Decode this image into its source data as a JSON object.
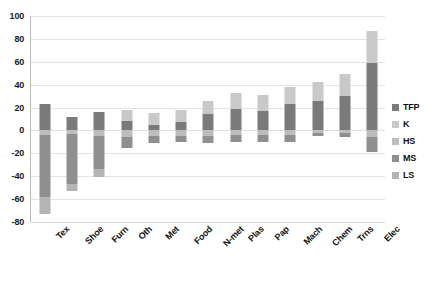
{
  "chart_data": {
    "type": "bar",
    "stacked": true,
    "title": "",
    "subtitle": "",
    "xlabel": "",
    "ylabel": "",
    "ylim": [
      -80,
      100
    ],
    "ytick_step": 20,
    "yticks": [
      100,
      80,
      60,
      40,
      20,
      0,
      -20,
      -40,
      -60,
      -80
    ],
    "ytick_labels": [
      "100",
      "80",
      "60",
      "40",
      "20",
      "0",
      "-20",
      "-40",
      "-60",
      "-80"
    ],
    "grid": true,
    "grid_axis": "y",
    "legend_position": "right",
    "categories": [
      "Tex",
      "Shoe",
      "Furn",
      "Oth",
      "Met",
      "Food",
      "N-met",
      "Plas",
      "Pap",
      "Mach",
      "Chem",
      "Trns",
      "Elec"
    ],
    "series": [
      {
        "name": "TFP",
        "color": "#7a7a7a",
        "values": [
          23,
          12,
          16,
          8,
          5,
          7,
          14,
          19,
          17,
          23,
          26,
          30,
          59
        ]
      },
      {
        "name": "K",
        "color": "#c9c9c9",
        "values": [
          0,
          0,
          0,
          10,
          10,
          11,
          12,
          14,
          14,
          15,
          16,
          19,
          28
        ]
      },
      {
        "name": "HS",
        "color": "#bdbdbd",
        "values": [
          -4,
          -3,
          -5,
          -6,
          -5,
          -5,
          -5,
          -4,
          -4,
          -4,
          -2,
          -2,
          -6
        ]
      },
      {
        "name": "MS",
        "color": "#8f8f8f",
        "values": [
          -54,
          -44,
          -29,
          -9,
          -6,
          -5,
          -6,
          -6,
          -6,
          -6,
          -3,
          -4,
          -13
        ]
      },
      {
        "name": "LS",
        "color": "#b4b4b4",
        "values": [
          -15,
          -6,
          -7,
          0,
          0,
          0,
          0,
          0,
          0,
          0,
          0,
          0,
          0
        ]
      }
    ],
    "totals": [
      -50,
      -41,
      -25,
      3,
      4,
      8,
      15,
      23,
      21,
      28,
      37,
      43,
      68
    ]
  },
  "legend": {
    "items": [
      {
        "label": "TFP",
        "swatch": "tfp"
      },
      {
        "label": "K",
        "swatch": "k"
      },
      {
        "label": "HS",
        "swatch": "hs"
      },
      {
        "label": "MS",
        "swatch": "ms"
      },
      {
        "label": "LS",
        "swatch": "ls"
      }
    ]
  }
}
